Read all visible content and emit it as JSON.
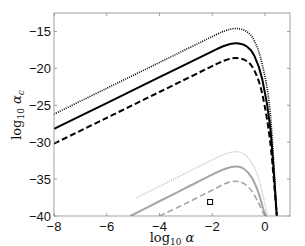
{
  "chart_data": {
    "type": "line",
    "title": "",
    "xlabel": "log10 α",
    "ylabel": "log10 α_c",
    "xlabel_main": "log",
    "xlabel_sub": "10",
    "xlabel_sym": " α",
    "ylabel_main": "log",
    "ylabel_sub": "10",
    "ylabel_sym": " α",
    "ylabel_sym_sub": "c",
    "xlim": [
      -8,
      0.95
    ],
    "ylim": [
      -40,
      -12.5
    ],
    "xticks": [
      -8,
      -6,
      -4,
      -2,
      0
    ],
    "xtick_labels": [
      "−8",
      "−6",
      "−4",
      "−2",
      "0"
    ],
    "yticks": [
      -15,
      -20,
      -25,
      -30,
      -35,
      -40
    ],
    "ytick_labels": [
      "−15",
      "−20",
      "−25",
      "−30",
      "−35",
      "−40"
    ],
    "grid": false,
    "legend": "none",
    "series": [
      {
        "name": "upper-dotted-black",
        "color": "#000000",
        "style": "dotted",
        "width": 1.6,
        "x": [
          -8,
          -6,
          -4,
          -2,
          -1.5,
          -1.1,
          -0.7,
          -0.4,
          -0.1,
          0.2,
          0.45
        ],
        "y": [
          -26.2,
          -22.7,
          -19.2,
          -15.7,
          -14.9,
          -14.6,
          -15.0,
          -16.3,
          -19.5,
          -26.0,
          -40
        ]
      },
      {
        "name": "upper-solid-black",
        "color": "#000000",
        "style": "solid",
        "width": 2,
        "x": [
          -8,
          -6,
          -4,
          -2,
          -1.5,
          -1.1,
          -0.7,
          -0.4,
          -0.1,
          0.2,
          0.45
        ],
        "y": [
          -28.2,
          -24.7,
          -21.2,
          -17.7,
          -16.9,
          -16.6,
          -17.0,
          -18.3,
          -21.5,
          -28.0,
          -40
        ]
      },
      {
        "name": "upper-dashed-black",
        "color": "#000000",
        "style": "dashed",
        "width": 2,
        "x": [
          -8,
          -6,
          -4,
          -2,
          -1.5,
          -1.1,
          -0.7,
          -0.4,
          -0.1,
          0.2,
          0.45
        ],
        "y": [
          -30.2,
          -26.7,
          -23.2,
          -19.7,
          -18.9,
          -18.6,
          -19.0,
          -20.3,
          -23.5,
          -30.0,
          -40
        ]
      },
      {
        "name": "lower-dotted-gray",
        "color": "#bdbdbd",
        "style": "dotted",
        "width": 1.4,
        "x": [
          -4.9,
          -4,
          -3,
          -2,
          -1.5,
          -1.1,
          -0.8,
          -0.5,
          -0.25,
          -0.05,
          0.1
        ],
        "y": [
          -37.6,
          -36.0,
          -34.2,
          -32.4,
          -31.6,
          -31.3,
          -31.6,
          -32.8,
          -34.8,
          -37.6,
          -40
        ]
      },
      {
        "name": "lower-solid-gray",
        "color": "#a6a6a6",
        "style": "solid",
        "width": 2,
        "x": [
          -5.1,
          -4,
          -3,
          -2,
          -1.5,
          -1.1,
          -0.8,
          -0.5,
          -0.25,
          -0.05,
          0.05
        ],
        "y": [
          -40.0,
          -38.0,
          -36.2,
          -34.4,
          -33.6,
          -33.3,
          -33.6,
          -34.8,
          -36.8,
          -39.2,
          -40
        ]
      },
      {
        "name": "lower-dashed-gray",
        "color": "#a6a6a6",
        "style": "dashed",
        "width": 1.6,
        "x": [
          -4,
          -3,
          -2,
          -1.5,
          -1.1,
          -0.8,
          -0.5,
          -0.25,
          -0.1,
          0.0
        ],
        "y": [
          -40.0,
          -38.3,
          -36.5,
          -35.6,
          -35.3,
          -35.6,
          -36.6,
          -38.2,
          -39.3,
          -40
        ]
      }
    ],
    "markers": [
      {
        "name": "square-marker",
        "x": -2.08,
        "y": -38.1,
        "shape": "square"
      }
    ]
  }
}
